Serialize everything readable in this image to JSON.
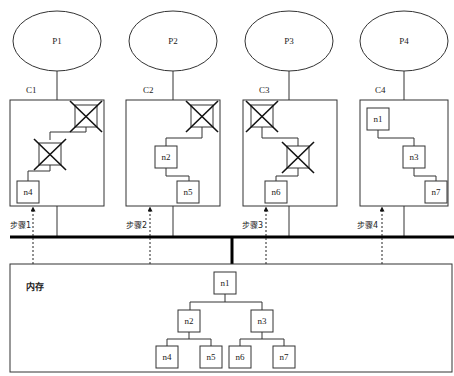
{
  "diagram": {
    "processors": [
      {
        "id": "P1",
        "label": "P1",
        "cache": "C1",
        "step": "步骤1"
      },
      {
        "id": "P2",
        "label": "P2",
        "cache": "C2",
        "step": "步骤2"
      },
      {
        "id": "P3",
        "label": "P3",
        "cache": "C3",
        "step": "步骤3"
      },
      {
        "id": "P4",
        "label": "P4",
        "cache": "C4",
        "step": "步骤4"
      }
    ],
    "caches": [
      {
        "label": "C1",
        "nodes": [
          {
            "label": "",
            "crossed": true
          },
          {
            "label": "",
            "crossed": true
          },
          {
            "label": "n4",
            "crossed": false
          }
        ]
      },
      {
        "label": "C2",
        "nodes": [
          {
            "label": "",
            "crossed": true
          },
          {
            "label": "n2",
            "crossed": false
          },
          {
            "label": "n5",
            "crossed": false
          }
        ]
      },
      {
        "label": "C3",
        "nodes": [
          {
            "label": "",
            "crossed": true
          },
          {
            "label": "",
            "crossed": true
          },
          {
            "label": "n6",
            "crossed": false
          }
        ]
      },
      {
        "label": "C4",
        "nodes": [
          {
            "label": "n1",
            "crossed": false
          },
          {
            "label": "n3",
            "crossed": false
          },
          {
            "label": "n7",
            "crossed": false
          }
        ]
      }
    ],
    "memory": {
      "label": "内存",
      "tree": {
        "root": "n1",
        "level2": [
          "n2",
          "n3"
        ],
        "level3": [
          "n4",
          "n5",
          "n6",
          "n7"
        ]
      }
    },
    "colors": {
      "stroke": "#333333",
      "bus": "#000000",
      "background": "#ffffff"
    }
  }
}
